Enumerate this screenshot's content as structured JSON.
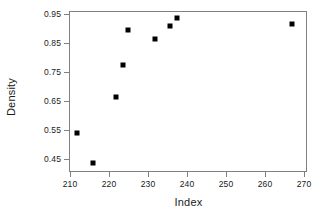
{
  "chart_data": {
    "type": "scatter",
    "title": "",
    "xlabel": "Index",
    "ylabel": "Density",
    "xlim": [
      206,
      271
    ],
    "ylim": [
      0.415,
      0.966
    ],
    "grid": false,
    "legend": null,
    "xticks": [
      210,
      220,
      230,
      240,
      250,
      260,
      270
    ],
    "xticklabels": [
      "210",
      "220",
      "230",
      "240",
      "250",
      "260",
      "270"
    ],
    "yticks": [
      0.45,
      0.55,
      0.65,
      0.75,
      0.85,
      0.95
    ],
    "yticklabels": [
      "0.45",
      "0.55",
      "0.65",
      "0.75",
      "0.85",
      "0.95"
    ],
    "marker": "square",
    "marker_color": "#000000",
    "marker_size_px": 5,
    "frame_color": "#808080",
    "background_color": "#ffffff",
    "points": [
      {
        "x": 211.5,
        "y": 0.543
      },
      {
        "x": 215.6,
        "y": 0.44
      },
      {
        "x": 221.5,
        "y": 0.667
      },
      {
        "x": 223.3,
        "y": 0.777
      },
      {
        "x": 224.6,
        "y": 0.9
      },
      {
        "x": 231.5,
        "y": 0.866
      },
      {
        "x": 235.4,
        "y": 0.913
      },
      {
        "x": 237.2,
        "y": 0.94
      },
      {
        "x": 266.7,
        "y": 0.92
      }
    ]
  }
}
